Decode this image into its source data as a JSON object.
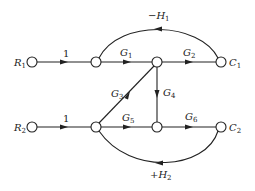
{
  "diagram": {
    "type": "signal-flow-graph",
    "nodes": [
      {
        "id": "R1",
        "label": "R",
        "sub": "1",
        "x": 32,
        "y": 62
      },
      {
        "id": "n2",
        "label": "",
        "x": 96,
        "y": 62
      },
      {
        "id": "n3",
        "label": "",
        "x": 157,
        "y": 62
      },
      {
        "id": "C1",
        "label": "C",
        "sub": "1",
        "x": 221,
        "y": 62
      },
      {
        "id": "R2",
        "label": "R",
        "sub": "2",
        "x": 32,
        "y": 127
      },
      {
        "id": "n6",
        "label": "",
        "x": 96,
        "y": 127
      },
      {
        "id": "n7",
        "label": "",
        "x": 157,
        "y": 127
      },
      {
        "id": "C2",
        "label": "C",
        "sub": "2",
        "x": 221,
        "y": 127
      }
    ],
    "edges": [
      {
        "from": "R1",
        "to": "n2",
        "gain": "1"
      },
      {
        "from": "n2",
        "to": "n3",
        "gain": "G",
        "sub": "1"
      },
      {
        "from": "n3",
        "to": "C1",
        "gain": "G",
        "sub": "2"
      },
      {
        "from": "C1",
        "to": "n2",
        "gain": "−H",
        "sub": "1",
        "kind": "feedback-arc-top"
      },
      {
        "from": "n6",
        "to": "n3",
        "gain": "G",
        "sub": "3"
      },
      {
        "from": "n3",
        "to": "n7",
        "gain": "G",
        "sub": "4"
      },
      {
        "from": "R2",
        "to": "n6",
        "gain": "1"
      },
      {
        "from": "n6",
        "to": "n7",
        "gain": "G",
        "sub": "5"
      },
      {
        "from": "n7",
        "to": "C2",
        "gain": "G",
        "sub": "6"
      },
      {
        "from": "C2",
        "to": "n6",
        "gain": "+H",
        "sub": "2",
        "kind": "feedback-arc-bottom"
      }
    ],
    "labels": {
      "R1": "R",
      "R1_sub": "1",
      "C1": "C",
      "C1_sub": "1",
      "R2": "R",
      "R2_sub": "2",
      "C2": "C",
      "C2_sub": "2",
      "e1": "1",
      "e2": "1",
      "G1": "G",
      "G1_sub": "1",
      "G2": "G",
      "G2_sub": "2",
      "G3": "G",
      "G3_sub": "3",
      "G4": "G",
      "G4_sub": "4",
      "G5": "G",
      "G5_sub": "5",
      "G6": "G",
      "G6_sub": "6",
      "H1": "−H",
      "H1_sub": "1",
      "H2": "+H",
      "H2_sub": "2"
    }
  }
}
